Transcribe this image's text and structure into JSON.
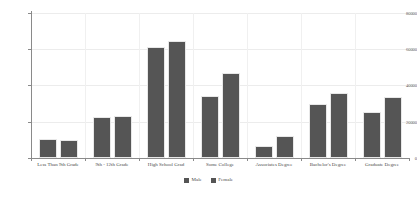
{
  "chart_data": {
    "type": "bar",
    "title": "",
    "xlabel": "",
    "ylabel": "",
    "categories": [
      "Less Than 9th Grade",
      "9th - 12th Grade",
      "High School Grad",
      "Some College",
      "Associates Degree",
      "Bachelor's Degree",
      "Graduate Degree"
    ],
    "series": [
      {
        "name": "Male",
        "color": "#555555",
        "values": [
          10500,
          22500,
          61500,
          34000,
          6500,
          30000,
          25500
        ]
      },
      {
        "name": "Female",
        "color": "#555555",
        "values": [
          10000,
          23300,
          64500,
          47000,
          12000,
          35800,
          33500
        ]
      }
    ],
    "ylim": [
      0,
      80000
    ],
    "yticks": [
      0,
      20000,
      40000,
      60000,
      80000
    ],
    "ytick_labels": [
      "0",
      "20000",
      "40000",
      "60000",
      "80000"
    ],
    "grid": true,
    "legend_position": "bottom"
  },
  "legend": {
    "items": [
      {
        "label": "Male"
      },
      {
        "label": "Female"
      }
    ]
  },
  "caption": {
    "text": ""
  }
}
